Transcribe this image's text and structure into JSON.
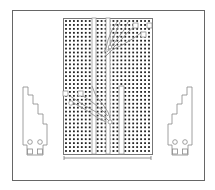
{
  "diagram": {
    "type": "stripboard-layout",
    "colors": {
      "frame": "#555555",
      "board_outline": "#777777",
      "hole": "#222222",
      "strip": "#999999",
      "bracket": "#888888"
    },
    "board": {
      "x": 63,
      "y": 18,
      "width": 89,
      "height": 136,
      "cols": 22,
      "rows": 34
    },
    "vertical_strips": [
      {
        "x": 92,
        "y": 18,
        "width": 4,
        "height": 136
      },
      {
        "x": 106,
        "y": 18,
        "width": 4,
        "height": 136
      },
      {
        "x": 119,
        "y": 86,
        "width": 5,
        "height": 68
      }
    ],
    "dimension_line": {
      "x1": 64,
      "x2": 151,
      "y": 158
    },
    "left_bracket": "mounting-bracket-left",
    "right_bracket": "mounting-bracket-right"
  }
}
